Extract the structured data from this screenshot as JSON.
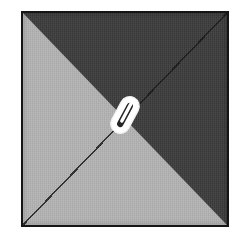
{
  "image": {
    "kind": "attachment-thumbnail",
    "alt_text": "Square thumbnail split diagonally into light gray and dark gray halves with a white paperclip in the center",
    "width": 248,
    "height": 248,
    "background_color": "#ffffff"
  },
  "plate": {
    "name": "diagonal-split-square",
    "border_color": "#151515",
    "border_width_px": 2,
    "light_half": {
      "label": "lower-left-triangle",
      "color": "#b4b4b4",
      "position": "lower-left"
    },
    "dark_half": {
      "label": "upper-right-triangle",
      "color": "#3b3b3b",
      "position": "upper-right"
    },
    "diagonal": {
      "label": "diagonal-divider",
      "color": "#141414",
      "direction": "top-left-to-bottom-right"
    }
  },
  "icon": {
    "name": "paperclip-icon",
    "label": "Paperclip",
    "fill_color": "#ffffff",
    "outline_color": "#1b1b1b",
    "rotation_deg": 28,
    "position": "center"
  }
}
